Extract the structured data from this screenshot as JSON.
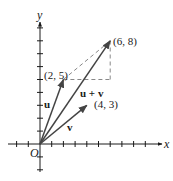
{
  "diagram": {
    "type": "vector-addition-parallelogram",
    "axes": {
      "x_label": "x",
      "y_label": "y",
      "origin_label": "O"
    },
    "points": {
      "u_end": {
        "label": "(2, 5)",
        "x": 2,
        "y": 5
      },
      "v_end": {
        "label": "(4, 3)",
        "x": 4,
        "y": 3
      },
      "sum_end": {
        "label": "(6, 8)",
        "x": 6,
        "y": 8
      }
    },
    "vectors": [
      {
        "name": "u",
        "label": "u",
        "from": [
          0,
          0
        ],
        "to": [
          2,
          5
        ]
      },
      {
        "name": "v",
        "label": "v",
        "from": [
          0,
          0
        ],
        "to": [
          4,
          3
        ]
      },
      {
        "name": "u+v",
        "label": "u + v",
        "from": [
          0,
          0
        ],
        "to": [
          6,
          8
        ]
      }
    ],
    "dashed_lines": [
      {
        "from": [
          2,
          5
        ],
        "to": [
          6,
          8
        ]
      },
      {
        "from": [
          2,
          5
        ],
        "to": [
          6,
          5
        ]
      },
      {
        "from": [
          6,
          5
        ],
        "to": [
          6,
          8
        ]
      }
    ],
    "colors": {
      "ink": "#1a1a1a",
      "vector": "#555555",
      "dashed": "#888888"
    }
  }
}
